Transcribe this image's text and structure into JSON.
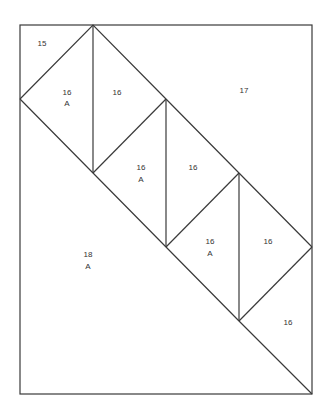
{
  "diagram": {
    "stroke_color": "#3a3a3a",
    "background": "#ffffff",
    "pieces": [
      {
        "id": "15",
        "label": "15",
        "sub": "",
        "x": 42,
        "y": 43
      },
      {
        "id": "16a-1",
        "label": "16",
        "sub": "A",
        "x": 67,
        "y": 92
      },
      {
        "id": "16-1",
        "label": "16",
        "sub": "",
        "x": 117,
        "y": 92
      },
      {
        "id": "17",
        "label": "17",
        "sub": "",
        "x": 244,
        "y": 90
      },
      {
        "id": "16a-2",
        "label": "16",
        "sub": "A",
        "x": 141,
        "y": 167
      },
      {
        "id": "16-2",
        "label": "16",
        "sub": "",
        "x": 193,
        "y": 167
      },
      {
        "id": "18a",
        "label": "18",
        "sub": "A",
        "x": 88,
        "y": 255
      },
      {
        "id": "16a-3",
        "label": "16",
        "sub": "A",
        "x": 210,
        "y": 241
      },
      {
        "id": "16-3",
        "label": "16",
        "sub": "",
        "x": 268,
        "y": 241
      },
      {
        "id": "16-4",
        "label": "16",
        "sub": "",
        "x": 288,
        "y": 322
      }
    ]
  }
}
